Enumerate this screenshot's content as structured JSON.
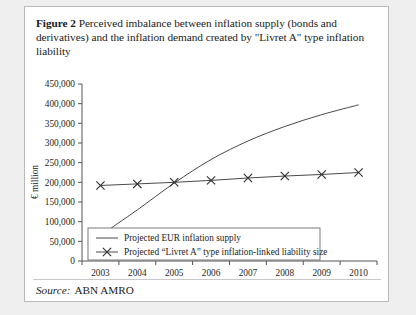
{
  "figure": {
    "number_label": "Figure 2",
    "caption": "Perceived imbalance between inflation supply (bonds and derivatives) and the inflation demand created by \"Livret A\" type inflation liability"
  },
  "source": {
    "label": "Source:",
    "value": "ABN AMRO"
  },
  "chart_data": {
    "type": "line",
    "title": "",
    "xlabel": "",
    "ylabel": "€ million",
    "categories": [
      "2003",
      "2004",
      "2005",
      "2006",
      "2007",
      "2008",
      "2009",
      "2010"
    ],
    "ylim": [
      0,
      450000
    ],
    "ytick_values": [
      0,
      50000,
      100000,
      150000,
      200000,
      250000,
      300000,
      350000,
      400000,
      450000
    ],
    "ytick_labels": [
      "0",
      "50,000",
      "100,000",
      "150,000",
      "200,000",
      "250,000",
      "300,000",
      "350,000",
      "400,000",
      "450,000"
    ],
    "grid": false,
    "legend_position": "bottom-center",
    "series": [
      {
        "name": "Projected EUR inflation supply",
        "marker": "none",
        "values": [
          65000,
          130000,
          198000,
          258000,
          305000,
          342000,
          372000,
          397000
        ]
      },
      {
        "name": "Projected “Livret A” type inflation-linked liability size",
        "marker": "x",
        "values": [
          192000,
          196000,
          200000,
          205000,
          211000,
          216000,
          220000,
          225000
        ]
      }
    ]
  }
}
